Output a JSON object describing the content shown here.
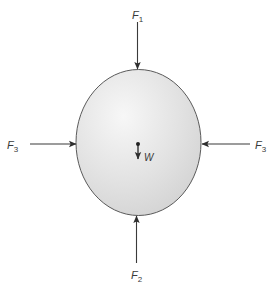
{
  "diagram": {
    "type": "free-body-diagram",
    "body": {
      "shape": "ellipse",
      "fill": "#e4e4e4",
      "stroke": "#555555"
    },
    "forces": [
      {
        "id": "F1",
        "symbol": "F",
        "subscript": "1",
        "direction": "down",
        "position": "top"
      },
      {
        "id": "F2",
        "symbol": "F",
        "subscript": "2",
        "direction": "up",
        "position": "bottom"
      },
      {
        "id": "F3_left",
        "symbol": "F",
        "subscript": "3",
        "direction": "right",
        "position": "left"
      },
      {
        "id": "F3_right",
        "symbol": "F",
        "subscript": "3",
        "direction": "left",
        "position": "right"
      }
    ],
    "weight": {
      "symbol": "W",
      "direction": "down",
      "position": "center"
    },
    "colors": {
      "arrow": "#333333",
      "text": "#3a3a3a"
    }
  }
}
